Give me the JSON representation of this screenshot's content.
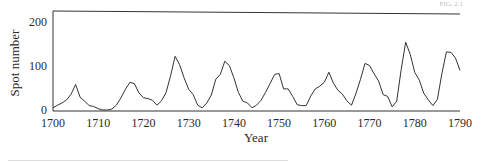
{
  "chart_data": {
    "type": "line",
    "title": "",
    "xlabel": "Year",
    "ylabel": "Spot number",
    "xlim": [
      1700,
      1790
    ],
    "ylim": [
      0,
      230
    ],
    "x_ticks": [
      1700,
      1710,
      1720,
      1730,
      1740,
      1750,
      1760,
      1770,
      1780,
      1790
    ],
    "y_ticks": [
      0,
      100,
      200
    ],
    "grid": false,
    "legend": null,
    "series": [
      {
        "name": "Spot number",
        "x": [
          1700,
          1701,
          1702,
          1703,
          1704,
          1705,
          1706,
          1707,
          1708,
          1709,
          1710,
          1711,
          1712,
          1713,
          1714,
          1715,
          1716,
          1717,
          1718,
          1719,
          1720,
          1721,
          1722,
          1723,
          1724,
          1725,
          1726,
          1727,
          1728,
          1729,
          1730,
          1731,
          1732,
          1733,
          1734,
          1735,
          1736,
          1737,
          1738,
          1739,
          1740,
          1741,
          1742,
          1743,
          1744,
          1745,
          1746,
          1747,
          1748,
          1749,
          1750,
          1751,
          1752,
          1753,
          1754,
          1755,
          1756,
          1757,
          1758,
          1759,
          1760,
          1761,
          1762,
          1763,
          1764,
          1765,
          1766,
          1767,
          1768,
          1769,
          1770,
          1771,
          1772,
          1773,
          1774,
          1775,
          1776,
          1777,
          1778,
          1779,
          1780,
          1781,
          1782,
          1783,
          1784,
          1785,
          1786,
          1787,
          1788,
          1789,
          1790
        ],
        "values": [
          5,
          11,
          16,
          23,
          36,
          58,
          29,
          20,
          10,
          8,
          3,
          0,
          0,
          2,
          11,
          27,
          47,
          63,
          60,
          39,
          28,
          26,
          22,
          11,
          21,
          40,
          78,
          122,
          103,
          73,
          47,
          35,
          11,
          5,
          16,
          34,
          70,
          81,
          111,
          101,
          73,
          40,
          20,
          16,
          5,
          11,
          22,
          40,
          60,
          81,
          83,
          48,
          48,
          31,
          12,
          10,
          10,
          32,
          48,
          54,
          63,
          86,
          61,
          45,
          36,
          21,
          11,
          38,
          70,
          106,
          101,
          82,
          66,
          35,
          31,
          7,
          20,
          92,
          154,
          126,
          85,
          68,
          38,
          23,
          10,
          24,
          83,
          132,
          131,
          118,
          90
        ]
      }
    ]
  },
  "header": {
    "faint_text": "FIG. 2.1"
  }
}
